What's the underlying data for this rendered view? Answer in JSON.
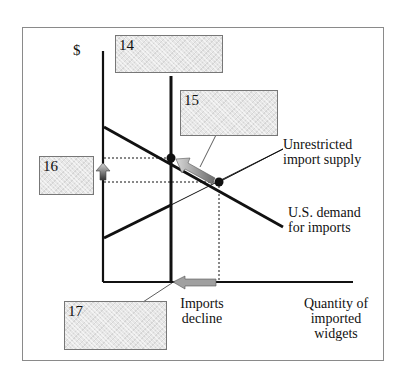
{
  "axes": {
    "y_label": "$",
    "x_label_lines": [
      "Quantity of",
      "imported",
      "widgets"
    ]
  },
  "curves": {
    "supply_label_lines": [
      "Unrestricted",
      "import supply"
    ],
    "demand_label_lines": [
      "U.S. demand",
      "for imports"
    ]
  },
  "annotation": {
    "imports_decline_lines": [
      "Imports",
      "decline"
    ]
  },
  "answer_boxes": [
    {
      "id": "14"
    },
    {
      "id": "15"
    },
    {
      "id": "16"
    },
    {
      "id": "17"
    }
  ],
  "colors": {
    "line": "#111111",
    "box_fill": "#e6e6e6",
    "arrow_fill": "#9a9a9a",
    "frame": "#8a8a8a"
  }
}
